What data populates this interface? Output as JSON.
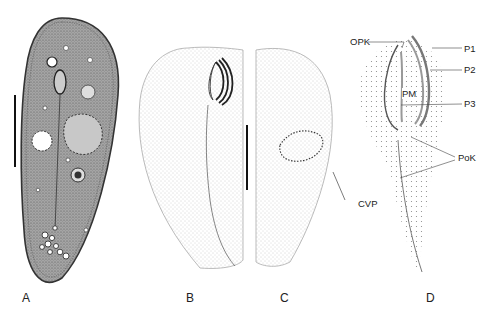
{
  "figure": {
    "panels": [
      {
        "id": "A",
        "label": "A"
      },
      {
        "id": "B",
        "label": "B"
      },
      {
        "id": "C",
        "label": "C"
      },
      {
        "id": "D",
        "label": "D"
      }
    ],
    "callouts": {
      "opk": "OPK",
      "p1": "P1",
      "p2": "P2",
      "pm": "PM",
      "p3": "P3",
      "pok": "PoK",
      "cvp": "CVP"
    },
    "colors": {
      "ink": "#222222",
      "stipple": "#9a9a9a",
      "body_fill": "#8c8c8c"
    }
  }
}
